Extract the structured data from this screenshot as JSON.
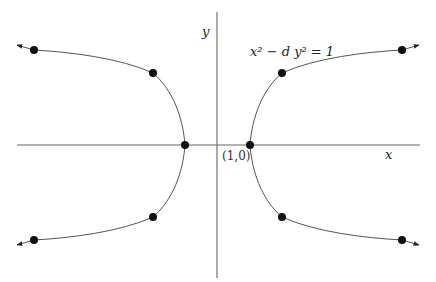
{
  "diagram": {
    "equation": "x² − d y² = 1",
    "axis_x_label": "x",
    "axis_y_label": "y",
    "vertex_label": "(1,0)",
    "colors": {
      "curve": "#555555",
      "axis": "#666666",
      "point": "#111111",
      "background": "#ffffff"
    },
    "points": [
      {
        "name": "left-vertex",
        "x": 185,
        "y": 145
      },
      {
        "name": "right-vertex",
        "x": 250,
        "y": 145
      },
      {
        "name": "left-upper-near",
        "x": 153,
        "y": 73
      },
      {
        "name": "left-upper-far",
        "x": 34,
        "y": 50
      },
      {
        "name": "left-lower-near",
        "x": 153,
        "y": 217
      },
      {
        "name": "left-lower-far",
        "x": 34,
        "y": 240
      },
      {
        "name": "right-upper-near",
        "x": 282,
        "y": 73
      },
      {
        "name": "right-upper-far",
        "x": 402,
        "y": 50
      },
      {
        "name": "right-lower-near",
        "x": 282,
        "y": 217
      },
      {
        "name": "right-lower-far",
        "x": 402,
        "y": 240
      }
    ]
  }
}
